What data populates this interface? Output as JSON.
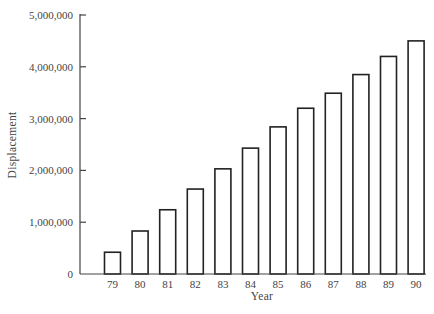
{
  "chart_data": {
    "type": "bar",
    "title": "",
    "xlabel": "Year",
    "ylabel": "Displacement",
    "categories": [
      "79",
      "80",
      "81",
      "82",
      "83",
      "84",
      "85",
      "86",
      "87",
      "88",
      "89",
      "90"
    ],
    "values": [
      420000,
      830000,
      1240000,
      1640000,
      2030000,
      2430000,
      2840000,
      3200000,
      3490000,
      3850000,
      4200000,
      4500000
    ],
    "ylim": [
      0,
      5000000
    ],
    "yticks": [
      0,
      1000000,
      2000000,
      3000000,
      4000000,
      5000000
    ],
    "ytick_labels": [
      "0",
      "1,000,000",
      "2,000,000",
      "3,000,000",
      "4,000,000",
      "5,000,000"
    ],
    "grid": false,
    "legend": null,
    "bar_fill": "#ffffff",
    "bar_stroke": "#222222"
  },
  "layout": {
    "plot_left": 80,
    "plot_right": 426,
    "plot_top": 15,
    "plot_bottom": 274,
    "first_bar_center": 112.5,
    "bar_spacing": 27.6,
    "bar_width": 16
  }
}
